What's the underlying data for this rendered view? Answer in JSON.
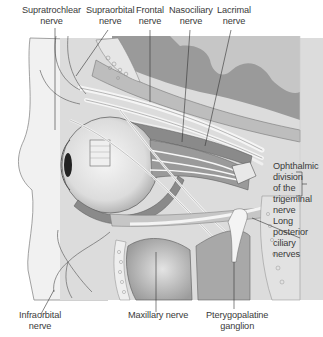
{
  "figure": {
    "colors": {
      "background": "#ffffff",
      "bone_dark": "#8a8a8a",
      "bone_mid": "#b0b0b0",
      "tissue_light": "#d8d8d8",
      "tissue_pale": "#ececec",
      "muscle": "#7a7a7a",
      "nerve": "#f4f4f4",
      "outline": "#555555",
      "leader_line": "#333333",
      "text": "#3a3a3a"
    }
  },
  "labels": {
    "supratrochlear": {
      "line1": "Supratrochlear",
      "line2": "nerve"
    },
    "supraorbital": {
      "line1": "Supraorbital",
      "line2": "nerve"
    },
    "frontal": {
      "line1": "Frontal",
      "line2": "nerve"
    },
    "nasociliary": {
      "line1": "Nasociliary",
      "line2": "nerve"
    },
    "lacrimal": {
      "line1": "Lacrimal",
      "line2": "nerve"
    },
    "ophthalmic": {
      "line1": "Ophthalmic",
      "line2": "division",
      "line3": "of the",
      "line4": "trigeminal",
      "line5": "nerve"
    },
    "long_posterior_ciliary": {
      "line1": "Long",
      "line2": "posterior",
      "line3": "ciliary",
      "line4": "nerves"
    },
    "infraorbital": {
      "line1": "Infraorbital",
      "line2": "nerve"
    },
    "maxillary": {
      "line1": "Maxillary nerve"
    },
    "pterygopalatine": {
      "line1": "Pterygopalatine",
      "line2": "ganglion"
    }
  }
}
